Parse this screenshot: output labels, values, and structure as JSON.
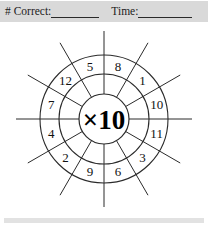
{
  "worksheet": {
    "header": {
      "correct_label": "# Correct:",
      "correct_value": "",
      "time_label": "Time:",
      "time_value": ""
    },
    "wheel": {
      "center_label": "×10",
      "multiplier": 10,
      "operator": "×",
      "sector_count": 12,
      "sectors": [
        {
          "position": 1,
          "label": "8",
          "angle_deg": -75
        },
        {
          "position": 2,
          "label": "1",
          "angle_deg": -45
        },
        {
          "position": 3,
          "label": "10",
          "angle_deg": -15
        },
        {
          "position": 4,
          "label": "11",
          "angle_deg": 15
        },
        {
          "position": 5,
          "label": "3",
          "angle_deg": 45
        },
        {
          "position": 6,
          "label": "6",
          "angle_deg": 75
        },
        {
          "position": 7,
          "label": "9",
          "angle_deg": 105
        },
        {
          "position": 8,
          "label": "2",
          "angle_deg": 135
        },
        {
          "position": 9,
          "label": "4",
          "angle_deg": 165
        },
        {
          "position": 10,
          "label": "7",
          "angle_deg": 195
        },
        {
          "position": 11,
          "label": "12",
          "angle_deg": 225
        },
        {
          "position": 12,
          "label": "5",
          "angle_deg": 255
        }
      ]
    },
    "colors": {
      "header_band": "#d9d9d9",
      "footer_band": "#e2e2e2",
      "line": "#2b2b2b",
      "text": "#111111",
      "page": "#ffffff"
    }
  }
}
